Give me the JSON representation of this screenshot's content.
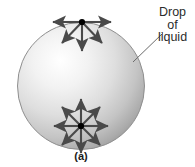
{
  "figure": {
    "caption": "(a)",
    "annotation": {
      "lines": [
        "Drop",
        "of",
        "liquid"
      ],
      "leader_line": {
        "x1": 133,
        "y1": 62,
        "x2": 163,
        "y2": 33
      }
    },
    "sphere": {
      "center_x": 81,
      "center_y": 86,
      "radius": 64,
      "fill_light": "#ffffff",
      "fill_mid": "#d8d8d8",
      "fill_edge": "#9a9a9a",
      "outline_color": "#8f8f8f"
    },
    "arrow_color": "#4a4a4a",
    "dot_color": "#000000",
    "clusters": [
      {
        "name": "surface-molecule",
        "center_x": 82,
        "center_y": 22,
        "arrow_length": 30,
        "angles_deg": [
          180,
          0,
          135,
          90,
          45
        ],
        "count": 5
      },
      {
        "name": "interior-molecule",
        "center_x": 81,
        "center_y": 126,
        "arrow_length": 27,
        "angles_deg": [
          0,
          45,
          90,
          135,
          180,
          225,
          270,
          315
        ],
        "count": 8
      }
    ]
  }
}
